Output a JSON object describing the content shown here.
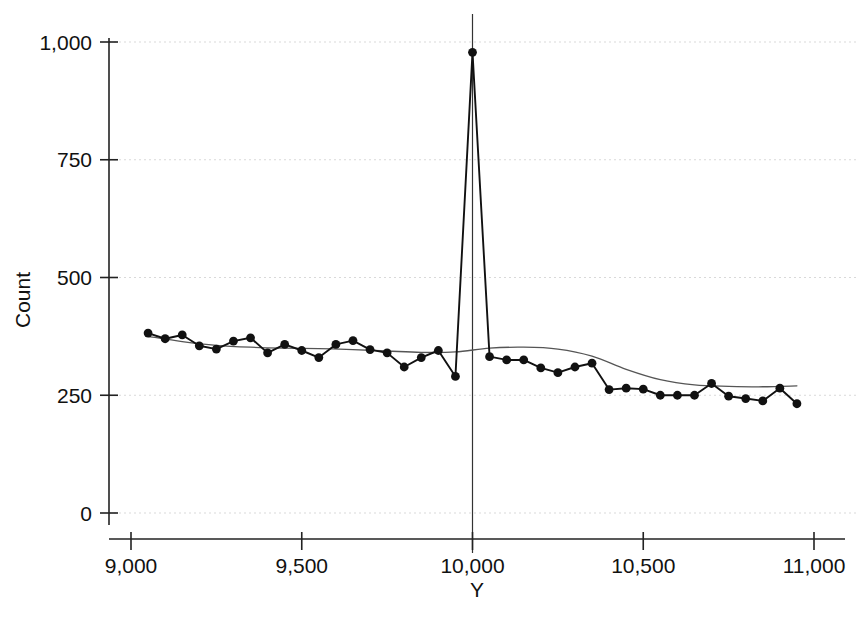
{
  "chart_data": {
    "type": "line",
    "title": "",
    "subtitle": "",
    "xlabel": "Y",
    "ylabel": "Count",
    "xlim": [
      8950,
      11000
    ],
    "ylim": [
      0,
      1040
    ],
    "xticks": [
      9000,
      9500,
      10000,
      10500,
      11000
    ],
    "xticklabels": [
      "9,000",
      "9,500",
      "10,000",
      "10,500",
      "11,000"
    ],
    "yticks": [
      0,
      250,
      500,
      750,
      1000
    ],
    "yticklabels": [
      "0",
      "250",
      "500",
      "750",
      "1,000"
    ],
    "grid": true,
    "grid_axis": "y",
    "legend": "none",
    "annotations": [
      {
        "type": "vline",
        "x": 10000,
        "label": ""
      }
    ],
    "colors": {
      "series": "#111111",
      "smooth": "#555555",
      "grid": "#d9d9d9",
      "axis": "#222222",
      "reference_line": "#333333",
      "background": "#ffffff"
    },
    "series": [
      {
        "name": "Count",
        "style": "line-with-markers",
        "marker": "circle",
        "x": [
          9050,
          9100,
          9150,
          9200,
          9250,
          9300,
          9350,
          9400,
          9450,
          9500,
          9550,
          9600,
          9650,
          9700,
          9750,
          9800,
          9850,
          9900,
          9950,
          10000,
          10050,
          10100,
          10150,
          10200,
          10250,
          10300,
          10350,
          10400,
          10450,
          10500,
          10550,
          10600,
          10650,
          10700,
          10750,
          10800,
          10850,
          10900,
          10950
        ],
        "values": [
          382,
          370,
          378,
          355,
          348,
          365,
          372,
          340,
          358,
          345,
          330,
          358,
          366,
          347,
          340,
          310,
          330,
          345,
          290,
          978,
          332,
          325,
          325,
          308,
          298,
          310,
          318,
          262,
          265,
          263,
          250,
          250,
          250,
          275,
          248,
          243,
          238,
          265,
          232
        ]
      },
      {
        "name": "Smoothed trend",
        "style": "line",
        "marker": "none",
        "x": [
          9050,
          9150,
          9250,
          9350,
          9450,
          9550,
          9650,
          9750,
          9850,
          9950,
          10050,
          10150,
          10250,
          10350,
          10450,
          10550,
          10650,
          10750,
          10850,
          10950
        ],
        "values": [
          375,
          364,
          356,
          352,
          350,
          349,
          347,
          344,
          341,
          342,
          350,
          352,
          348,
          333,
          305,
          283,
          272,
          269,
          268,
          270
        ]
      }
    ]
  },
  "axes": {
    "y_axis_title": "Count",
    "x_axis_title": "Y"
  }
}
